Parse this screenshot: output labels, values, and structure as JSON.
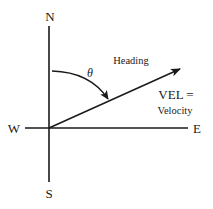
{
  "diagram": {
    "type": "compass-vector",
    "compass": {
      "north": "N",
      "south": "S",
      "east": "E",
      "west": "W"
    },
    "angle_label": "θ",
    "heading_label": "Heading",
    "vector_label_line1": "VEL =",
    "vector_label_line2": "Velocity",
    "colors": {
      "ink": "#1a1a1a",
      "background": "#ffffff"
    }
  }
}
